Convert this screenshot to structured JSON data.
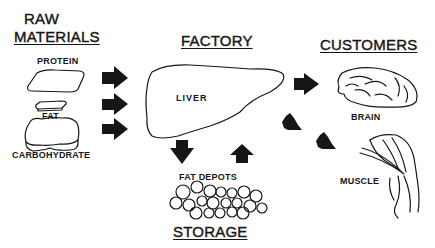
{
  "headings": {
    "raw_materials_line1": "RAW",
    "raw_materials_line2": "MATERIALS",
    "factory": "FACTORY",
    "customers": "CUSTOMERS",
    "storage": "STORAGE"
  },
  "raw_materials": [
    {
      "label": "PROTEIN"
    },
    {
      "label": "FAT"
    },
    {
      "label": "CARBOHYDRATE"
    }
  ],
  "factory": {
    "organ": "LIVER"
  },
  "storage": {
    "label": "FAT DEPOTS"
  },
  "customers": [
    {
      "label": "BRAIN"
    },
    {
      "label": "MUSCLE"
    }
  ],
  "arrows": [
    {
      "from": "PROTEIN",
      "to": "LIVER",
      "direction": "right"
    },
    {
      "from": "FAT",
      "to": "LIVER",
      "direction": "right"
    },
    {
      "from": "CARBOHYDRATE",
      "to": "LIVER",
      "direction": "right"
    },
    {
      "from": "LIVER",
      "to": "FAT DEPOTS",
      "direction": "down"
    },
    {
      "from": "FAT DEPOTS",
      "to": "LIVER",
      "direction": "up"
    },
    {
      "from": "LIVER",
      "to": "BRAIN",
      "direction": "right"
    },
    {
      "from": "LIVER",
      "to": "MUSCLE",
      "direction": "down-right"
    }
  ],
  "colors": {
    "ink": "#161616",
    "background": "#ffffff"
  }
}
